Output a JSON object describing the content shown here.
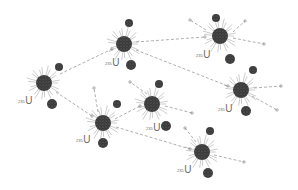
{
  "diagram": {
    "colors": {
      "nucleus": "#3a3a3a",
      "fragment": "#444444",
      "rays": "#9a9a9a",
      "neutron_path": "#9a9a9a",
      "label": "#6a6a6a"
    },
    "nucleus_label": {
      "mass": "235",
      "symbol": "U"
    },
    "neutron_label": "¹n",
    "nuclei": [
      {
        "id": "n1",
        "x": 44,
        "y": 83,
        "r": 8,
        "label_x": 18,
        "label_y": 96,
        "fragments": [
          [
            59,
            67,
            4
          ],
          [
            52,
            104,
            5
          ]
        ]
      },
      {
        "id": "n2",
        "x": 124,
        "y": 44,
        "r": 8,
        "label_x": 105,
        "label_y": 58,
        "fragments": [
          [
            129,
            23,
            4
          ],
          [
            131,
            65,
            5
          ]
        ]
      },
      {
        "id": "n3",
        "x": 220,
        "y": 36,
        "r": 8,
        "label_x": 196,
        "label_y": 50,
        "fragments": [
          [
            216,
            18,
            4
          ],
          [
            230,
            59,
            5
          ]
        ]
      },
      {
        "id": "n4",
        "x": 241,
        "y": 90,
        "r": 8,
        "label_x": 218,
        "label_y": 104,
        "fragments": [
          [
            253,
            70,
            4
          ],
          [
            246,
            111,
            5
          ]
        ]
      },
      {
        "id": "n5",
        "x": 152,
        "y": 104,
        "r": 8,
        "label_x": 146,
        "label_y": 123,
        "fragments": [
          [
            159,
            84,
            4
          ],
          [
            166,
            126,
            5
          ]
        ]
      },
      {
        "id": "n6",
        "x": 103,
        "y": 123,
        "r": 8,
        "label_x": 76,
        "label_y": 135,
        "fragments": [
          [
            117,
            104,
            4
          ],
          [
            103,
            143,
            5
          ]
        ]
      },
      {
        "id": "n7",
        "x": 202,
        "y": 152,
        "r": 8,
        "label_x": 177,
        "label_y": 165,
        "fragments": [
          [
            210,
            131,
            4
          ],
          [
            208,
            173,
            5
          ]
        ]
      }
    ],
    "neutron_paths": [
      {
        "from": [
          60,
          74
        ],
        "to": [
          112,
          49
        ]
      },
      {
        "from": [
          56,
          92
        ],
        "to": [
          92,
          116
        ]
      },
      {
        "from": [
          136,
          42
        ],
        "to": [
          205,
          37
        ]
      },
      {
        "from": [
          136,
          50
        ],
        "to": [
          228,
          86
        ]
      },
      {
        "from": [
          115,
          119
        ],
        "to": [
          140,
          106
        ]
      },
      {
        "from": [
          116,
          127
        ],
        "to": [
          190,
          149
        ]
      },
      {
        "from": [
          233,
          38
        ],
        "to": [
          264,
          44
        ]
      },
      {
        "from": [
          233,
          32
        ],
        "to": [
          245,
          21
        ]
      },
      {
        "from": [
          206,
          30
        ],
        "to": [
          190,
          20
        ]
      },
      {
        "from": [
          254,
          88
        ],
        "to": [
          281,
          86
        ]
      },
      {
        "from": [
          252,
          96
        ],
        "to": [
          277,
          110
        ]
      },
      {
        "from": [
          165,
          106
        ],
        "to": [
          192,
          113
        ]
      },
      {
        "from": [
          147,
          94
        ],
        "to": [
          130,
          82
        ]
      },
      {
        "from": [
          98,
          112
        ],
        "to": [
          94,
          88
        ]
      },
      {
        "from": [
          214,
          155
        ],
        "to": [
          244,
          162
        ]
      },
      {
        "from": [
          196,
          142
        ],
        "to": [
          185,
          128
        ]
      }
    ]
  }
}
